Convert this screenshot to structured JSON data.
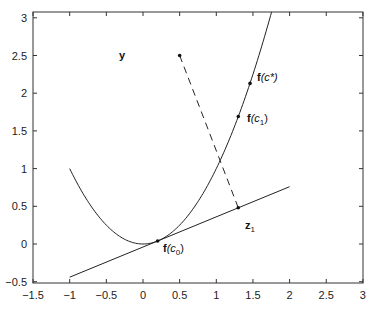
{
  "chart_data": {
    "type": "line",
    "title": "",
    "xlabel": "",
    "ylabel": "",
    "xlim": [
      -1.5,
      3
    ],
    "ylim": [
      -0.5,
      3.08
    ],
    "grid": false,
    "legend": null,
    "x_ticks": [
      "-1.5",
      "-1",
      "-0.5",
      "0",
      "0.5",
      "1",
      "1.5",
      "2",
      "2.5",
      "3"
    ],
    "y_ticks": [
      "-0.5",
      "0",
      "0.5",
      "1",
      "1.5",
      "2",
      "2.5",
      "3"
    ],
    "series": [
      {
        "name": "f(x) = x^2 (parabola)",
        "style": "solid",
        "x": [
          -1,
          -0.75,
          -0.5,
          -0.25,
          0,
          0.25,
          0.5,
          0.75,
          1,
          1.25,
          1.5,
          1.75
        ],
        "y": [
          1,
          0.5625,
          0.25,
          0.0625,
          0,
          0.0625,
          0.25,
          0.5625,
          1,
          1.5625,
          2.25,
          3.0625
        ]
      },
      {
        "name": "tangent line at c0",
        "style": "solid",
        "x": [
          -1,
          2
        ],
        "y": [
          -0.44,
          0.76
        ]
      },
      {
        "name": "projection from y to z1",
        "style": "dashed",
        "x": [
          0.5,
          1.3
        ],
        "y": [
          2.5,
          0.48
        ]
      }
    ],
    "points": [
      {
        "label": "y",
        "x": 0.5,
        "y": 2.5
      },
      {
        "label": "f(c*)",
        "x": 1.46,
        "y": 2.13
      },
      {
        "label": "f(c1)",
        "x": 1.3,
        "y": 1.69
      },
      {
        "label": "f(c0)",
        "x": 0.2,
        "y": 0.04
      },
      {
        "label": "z1",
        "x": 1.3,
        "y": 0.48
      }
    ],
    "annotations": [
      {
        "text": "y",
        "x": 0.25,
        "y": 2.5
      },
      {
        "text": "f(c*)",
        "x": 1.5,
        "y": 2.18
      },
      {
        "text": "f(c1)",
        "x": 1.4,
        "y": 1.62
      },
      {
        "text": "f(c0)",
        "x": 0.25,
        "y": -0.05
      },
      {
        "text": "z1",
        "x": 1.3,
        "y": 0.28
      }
    ]
  },
  "labels": {
    "y": "y",
    "fcstar_f": "f",
    "fcstar_arg": "(c*)",
    "fc1_f": "f",
    "fc1_c": "(c",
    "fc1_sub": "1",
    "fc0_f": "f",
    "fc0_c": "(c",
    "fc0_sub": "0",
    "z1_z": "z",
    "z1_sub": "1",
    "close_paren": ")"
  }
}
